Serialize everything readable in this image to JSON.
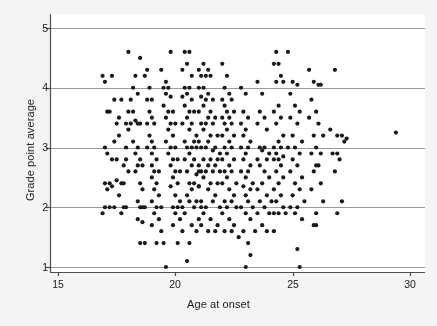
{
  "figure": {
    "background_color": "#f4f4f4",
    "plot_background_color": "#ffffff",
    "axis_color": "#4d4d4d",
    "grid_color": "#9a9a9a",
    "point_color": "#1a1a1a"
  },
  "chart_data": {
    "type": "scatter",
    "title": "",
    "subtitle": "",
    "xlabel": "Age at onset",
    "ylabel": "Grade point average",
    "xlim": [
      14.6,
      30.6
    ],
    "ylim": [
      0.85,
      5.15
    ],
    "xticks": [
      15,
      20,
      25,
      30
    ],
    "xtick_labels": [
      "15",
      "20",
      "25",
      "30"
    ],
    "yticks": [
      1,
      2,
      3,
      4,
      5
    ],
    "ytick_labels": [
      "1",
      "2",
      "3",
      "4",
      "5"
    ],
    "grid": "horizontal",
    "grid_at": [
      1,
      2,
      3,
      4,
      5
    ],
    "legend": "none",
    "marker": "filled-circle",
    "marker_size_px": 4.2,
    "n_points": 406,
    "points": [
      [
        16.9,
        4.2
      ],
      [
        17.0,
        4.1
      ],
      [
        17.3,
        4.2
      ],
      [
        17.1,
        3.6
      ],
      [
        17.2,
        3.6
      ],
      [
        17.0,
        3.0
      ],
      [
        17.1,
        2.9
      ],
      [
        17.0,
        2.4
      ],
      [
        17.2,
        2.4
      ],
      [
        17.3,
        2.35
      ],
      [
        17.1,
        2.3
      ],
      [
        17.0,
        2.0
      ],
      [
        16.9,
        1.9
      ],
      [
        17.2,
        2.0
      ],
      [
        17.4,
        2.0
      ],
      [
        17.3,
        2.8
      ],
      [
        17.5,
        2.8
      ],
      [
        17.4,
        3.1
      ],
      [
        17.6,
        3.2
      ],
      [
        17.5,
        3.4
      ],
      [
        17.6,
        3.5
      ],
      [
        17.4,
        3.8
      ],
      [
        17.7,
        3.8
      ],
      [
        17.5,
        2.45
      ],
      [
        17.7,
        2.4
      ],
      [
        17.8,
        2.4
      ],
      [
        17.6,
        2.2
      ],
      [
        17.8,
        2.0
      ],
      [
        17.7,
        1.9
      ],
      [
        17.9,
        2.0
      ],
      [
        17.8,
        2.7
      ],
      [
        17.9,
        2.8
      ],
      [
        18.0,
        2.6
      ],
      [
        17.9,
        3.0
      ],
      [
        18.0,
        3.3
      ],
      [
        18.1,
        3.4
      ],
      [
        17.9,
        3.4
      ],
      [
        18.0,
        3.6
      ],
      [
        18.2,
        3.6
      ],
      [
        18.1,
        3.8
      ],
      [
        18.0,
        4.6
      ],
      [
        18.3,
        4.2
      ],
      [
        18.2,
        4.0
      ],
      [
        18.4,
        3.9
      ],
      [
        18.3,
        3.45
      ],
      [
        18.5,
        3.4
      ],
      [
        18.4,
        3.4
      ],
      [
        18.2,
        3.1
      ],
      [
        18.4,
        3.0
      ],
      [
        18.3,
        2.9
      ],
      [
        18.5,
        2.8
      ],
      [
        18.4,
        2.7
      ],
      [
        18.6,
        2.7
      ],
      [
        18.3,
        2.6
      ],
      [
        18.5,
        2.4
      ],
      [
        18.6,
        2.3
      ],
      [
        18.4,
        2.1
      ],
      [
        18.6,
        2.0
      ],
      [
        18.5,
        2.0
      ],
      [
        18.7,
        2.0
      ],
      [
        18.4,
        1.8
      ],
      [
        18.6,
        1.75
      ],
      [
        18.5,
        1.4
      ],
      [
        18.7,
        1.4
      ],
      [
        18.5,
        4.5
      ],
      [
        18.8,
        4.3
      ],
      [
        18.7,
        4.2
      ],
      [
        18.9,
        4.0
      ],
      [
        18.8,
        3.8
      ],
      [
        19.0,
        3.8
      ],
      [
        18.9,
        3.6
      ],
      [
        19.0,
        3.5
      ],
      [
        18.8,
        3.4
      ],
      [
        19.1,
        3.4
      ],
      [
        18.9,
        3.2
      ],
      [
        19.0,
        3.1
      ],
      [
        18.8,
        3.0
      ],
      [
        19.1,
        3.0
      ],
      [
        19.0,
        2.9
      ],
      [
        19.2,
        2.8
      ],
      [
        19.0,
        2.7
      ],
      [
        19.1,
        2.6
      ],
      [
        19.3,
        2.6
      ],
      [
        19.0,
        2.5
      ],
      [
        19.2,
        2.4
      ],
      [
        19.1,
        2.3
      ],
      [
        19.3,
        2.2
      ],
      [
        19.0,
        2.1
      ],
      [
        19.2,
        2.0
      ],
      [
        19.4,
        2.0
      ],
      [
        19.1,
        1.9
      ],
      [
        19.3,
        1.8
      ],
      [
        19.0,
        1.7
      ],
      [
        19.4,
        1.6
      ],
      [
        19.2,
        1.4
      ],
      [
        19.5,
        1.4
      ],
      [
        19.6,
        1.0
      ],
      [
        19.4,
        4.3
      ],
      [
        19.6,
        4.1
      ],
      [
        19.5,
        4.0
      ],
      [
        19.7,
        4.0
      ],
      [
        19.6,
        3.9
      ],
      [
        19.8,
        3.85
      ],
      [
        19.5,
        3.7
      ],
      [
        19.7,
        3.6
      ],
      [
        19.9,
        3.6
      ],
      [
        19.6,
        3.5
      ],
      [
        19.8,
        3.4
      ],
      [
        20.0,
        3.4
      ],
      [
        19.7,
        3.3
      ],
      [
        19.9,
        3.2
      ],
      [
        19.6,
        3.1
      ],
      [
        19.8,
        3.0
      ],
      [
        20.0,
        3.0
      ],
      [
        19.7,
        2.9
      ],
      [
        19.9,
        2.8
      ],
      [
        20.1,
        2.8
      ],
      [
        19.8,
        2.7
      ],
      [
        20.0,
        2.6
      ],
      [
        20.2,
        2.6
      ],
      [
        19.9,
        2.5
      ],
      [
        20.1,
        2.4
      ],
      [
        19.8,
        2.35
      ],
      [
        20.0,
        2.2
      ],
      [
        20.2,
        2.1
      ],
      [
        19.9,
        2.0
      ],
      [
        20.1,
        2.0
      ],
      [
        20.3,
        2.0
      ],
      [
        20.0,
        1.9
      ],
      [
        20.2,
        1.8
      ],
      [
        19.9,
        1.7
      ],
      [
        20.3,
        1.6
      ],
      [
        20.1,
        1.4
      ],
      [
        20.4,
        4.6
      ],
      [
        19.8,
        4.6
      ],
      [
        20.6,
        4.6
      ],
      [
        20.5,
        4.4
      ],
      [
        20.3,
        4.3
      ],
      [
        20.7,
        4.2
      ],
      [
        20.4,
        4.0
      ],
      [
        20.6,
        4.0
      ],
      [
        20.5,
        3.9
      ],
      [
        20.3,
        3.85
      ],
      [
        20.7,
        3.8
      ],
      [
        20.4,
        3.7
      ],
      [
        20.6,
        3.6
      ],
      [
        20.8,
        3.6
      ],
      [
        20.5,
        3.5
      ],
      [
        20.3,
        3.4
      ],
      [
        20.7,
        3.4
      ],
      [
        20.6,
        3.3
      ],
      [
        20.9,
        3.2
      ],
      [
        20.4,
        3.1
      ],
      [
        20.8,
        3.1
      ],
      [
        20.5,
        3.0
      ],
      [
        20.7,
        3.0
      ],
      [
        20.9,
        3.0
      ],
      [
        20.6,
        2.9
      ],
      [
        20.4,
        2.8
      ],
      [
        20.8,
        2.8
      ],
      [
        20.7,
        2.7
      ],
      [
        21.0,
        2.6
      ],
      [
        20.5,
        2.6
      ],
      [
        20.9,
        2.55
      ],
      [
        20.6,
        2.4
      ],
      [
        20.8,
        2.4
      ],
      [
        21.0,
        2.35
      ],
      [
        20.7,
        2.3
      ],
      [
        20.5,
        2.2
      ],
      [
        20.9,
        2.1
      ],
      [
        20.6,
        2.1
      ],
      [
        21.1,
        2.0
      ],
      [
        20.8,
        2.0
      ],
      [
        20.4,
        1.9
      ],
      [
        21.0,
        1.8
      ],
      [
        20.7,
        1.7
      ],
      [
        21.1,
        1.7
      ],
      [
        20.9,
        1.6
      ],
      [
        20.6,
        1.4
      ],
      [
        20.5,
        1.1
      ],
      [
        21.2,
        4.4
      ],
      [
        21.0,
        4.3
      ],
      [
        21.4,
        4.3
      ],
      [
        21.1,
        4.2
      ],
      [
        21.3,
        4.2
      ],
      [
        21.5,
        4.2
      ],
      [
        21.2,
        4.0
      ],
      [
        21.0,
        4.0
      ],
      [
        21.4,
        3.9
      ],
      [
        21.1,
        3.85
      ],
      [
        21.3,
        3.8
      ],
      [
        21.6,
        3.8
      ],
      [
        21.2,
        3.7
      ],
      [
        21.5,
        3.6
      ],
      [
        21.0,
        3.6
      ],
      [
        21.4,
        3.5
      ],
      [
        21.7,
        3.5
      ],
      [
        21.1,
        3.4
      ],
      [
        21.3,
        3.4
      ],
      [
        21.6,
        3.4
      ],
      [
        21.2,
        3.3
      ],
      [
        21.5,
        3.2
      ],
      [
        21.8,
        3.2
      ],
      [
        21.0,
        3.1
      ],
      [
        21.4,
        3.1
      ],
      [
        21.7,
        3.0
      ],
      [
        21.1,
        3.0
      ],
      [
        21.3,
        3.0
      ],
      [
        21.6,
        2.95
      ],
      [
        21.9,
        2.9
      ],
      [
        21.2,
        2.8
      ],
      [
        21.5,
        2.8
      ],
      [
        21.8,
        2.8
      ],
      [
        21.0,
        2.7
      ],
      [
        21.4,
        2.7
      ],
      [
        21.7,
        2.7
      ],
      [
        21.1,
        2.6
      ],
      [
        21.3,
        2.6
      ],
      [
        21.6,
        2.6
      ],
      [
        21.9,
        2.6
      ],
      [
        21.2,
        2.5
      ],
      [
        21.5,
        2.4
      ],
      [
        21.8,
        2.4
      ],
      [
        21.0,
        2.35
      ],
      [
        21.4,
        2.3
      ],
      [
        21.7,
        2.2
      ],
      [
        21.1,
        2.1
      ],
      [
        21.6,
        2.1
      ],
      [
        21.3,
        2.0
      ],
      [
        21.9,
        2.0
      ],
      [
        21.2,
        1.9
      ],
      [
        21.5,
        1.8
      ],
      [
        21.8,
        1.7
      ],
      [
        21.4,
        1.6
      ],
      [
        21.7,
        1.6
      ],
      [
        22.0,
        4.4
      ],
      [
        22.2,
        4.2
      ],
      [
        22.1,
        4.0
      ],
      [
        22.3,
        3.9
      ],
      [
        22.0,
        3.8
      ],
      [
        22.4,
        3.8
      ],
      [
        22.1,
        3.7
      ],
      [
        22.2,
        3.6
      ],
      [
        22.5,
        3.6
      ],
      [
        22.0,
        3.5
      ],
      [
        22.3,
        3.5
      ],
      [
        22.1,
        3.4
      ],
      [
        22.4,
        3.4
      ],
      [
        22.2,
        3.3
      ],
      [
        22.0,
        3.2
      ],
      [
        22.5,
        3.2
      ],
      [
        22.3,
        3.1
      ],
      [
        22.1,
        3.0
      ],
      [
        22.4,
        3.0
      ],
      [
        22.2,
        2.9
      ],
      [
        22.0,
        2.8
      ],
      [
        22.5,
        2.8
      ],
      [
        22.3,
        2.7
      ],
      [
        22.1,
        2.6
      ],
      [
        22.4,
        2.6
      ],
      [
        22.2,
        2.5
      ],
      [
        22.6,
        2.4
      ],
      [
        22.0,
        2.4
      ],
      [
        22.3,
        2.3
      ],
      [
        22.5,
        2.2
      ],
      [
        22.1,
        2.1
      ],
      [
        22.4,
        2.1
      ],
      [
        22.2,
        2.0
      ],
      [
        22.6,
        2.0
      ],
      [
        22.0,
        1.9
      ],
      [
        22.3,
        1.8
      ],
      [
        22.5,
        1.7
      ],
      [
        22.1,
        1.6
      ],
      [
        22.4,
        1.6
      ],
      [
        22.7,
        1.5
      ],
      [
        22.8,
        4.0
      ],
      [
        23.0,
        3.9
      ],
      [
        22.9,
        3.6
      ],
      [
        23.1,
        3.5
      ],
      [
        22.8,
        3.4
      ],
      [
        23.0,
        3.3
      ],
      [
        22.9,
        3.2
      ],
      [
        23.2,
        3.1
      ],
      [
        22.8,
        3.0
      ],
      [
        23.1,
        3.0
      ],
      [
        23.0,
        2.9
      ],
      [
        22.9,
        2.8
      ],
      [
        23.2,
        2.7
      ],
      [
        22.8,
        2.6
      ],
      [
        23.1,
        2.6
      ],
      [
        23.0,
        2.5
      ],
      [
        23.3,
        2.4
      ],
      [
        22.9,
        2.35
      ],
      [
        23.2,
        2.3
      ],
      [
        23.0,
        2.2
      ],
      [
        23.1,
        2.1
      ],
      [
        22.8,
        2.0
      ],
      [
        23.3,
        2.0
      ],
      [
        23.0,
        1.9
      ],
      [
        23.2,
        1.8
      ],
      [
        22.9,
        1.6
      ],
      [
        23.4,
        1.6
      ],
      [
        23.1,
        1.4
      ],
      [
        23.2,
        1.2
      ],
      [
        23.0,
        1.0
      ],
      [
        23.5,
        4.1
      ],
      [
        23.7,
        3.9
      ],
      [
        23.6,
        3.6
      ],
      [
        23.8,
        3.5
      ],
      [
        23.5,
        3.4
      ],
      [
        23.9,
        3.3
      ],
      [
        23.6,
        3.0
      ],
      [
        23.8,
        3.0
      ],
      [
        23.7,
        2.95
      ],
      [
        24.0,
        2.9
      ],
      [
        23.5,
        2.8
      ],
      [
        23.9,
        2.8
      ],
      [
        23.6,
        2.7
      ],
      [
        23.8,
        2.6
      ],
      [
        24.0,
        2.5
      ],
      [
        23.7,
        2.4
      ],
      [
        23.5,
        2.3
      ],
      [
        23.9,
        2.2
      ],
      [
        23.6,
        2.1
      ],
      [
        24.1,
        2.1
      ],
      [
        23.8,
        2.0
      ],
      [
        23.5,
        1.9
      ],
      [
        24.0,
        1.9
      ],
      [
        23.7,
        1.7
      ],
      [
        23.9,
        1.6
      ],
      [
        24.2,
        1.6
      ],
      [
        24.3,
        4.6
      ],
      [
        24.4,
        4.4
      ],
      [
        24.2,
        4.4
      ],
      [
        24.5,
        4.2
      ],
      [
        24.3,
        4.1
      ],
      [
        24.6,
        4.1
      ],
      [
        24.4,
        3.7
      ],
      [
        24.2,
        3.6
      ],
      [
        24.5,
        3.5
      ],
      [
        24.3,
        3.4
      ],
      [
        24.6,
        3.2
      ],
      [
        24.4,
        3.1
      ],
      [
        24.2,
        3.0
      ],
      [
        24.5,
        3.0
      ],
      [
        24.3,
        2.9
      ],
      [
        24.6,
        2.85
      ],
      [
        24.4,
        2.8
      ],
      [
        24.2,
        2.8
      ],
      [
        24.5,
        2.7
      ],
      [
        24.3,
        2.6
      ],
      [
        24.6,
        2.5
      ],
      [
        24.4,
        2.4
      ],
      [
        24.2,
        2.3
      ],
      [
        24.5,
        2.2
      ],
      [
        24.3,
        2.1
      ],
      [
        24.6,
        2.0
      ],
      [
        24.4,
        1.9
      ],
      [
        24.7,
        1.9
      ],
      [
        24.2,
        1.9
      ],
      [
        24.8,
        4.6
      ],
      [
        25.0,
        4.1
      ],
      [
        25.2,
        4.05
      ],
      [
        24.9,
        3.9
      ],
      [
        25.1,
        3.7
      ],
      [
        25.3,
        3.6
      ],
      [
        24.9,
        3.5
      ],
      [
        25.2,
        3.4
      ],
      [
        25.0,
        3.2
      ],
      [
        25.4,
        3.1
      ],
      [
        24.8,
        3.0
      ],
      [
        25.1,
        3.0
      ],
      [
        25.3,
        2.9
      ],
      [
        25.0,
        2.8
      ],
      [
        25.2,
        2.7
      ],
      [
        24.9,
        2.6
      ],
      [
        25.4,
        2.5
      ],
      [
        25.1,
        2.4
      ],
      [
        25.3,
        2.3
      ],
      [
        25.0,
        2.2
      ],
      [
        25.5,
        2.1
      ],
      [
        25.2,
        2.0
      ],
      [
        24.9,
        2.0
      ],
      [
        25.1,
        1.9
      ],
      [
        25.4,
        1.8
      ],
      [
        25.2,
        1.3
      ],
      [
        25.3,
        1.0
      ],
      [
        25.7,
        4.3
      ],
      [
        25.9,
        4.1
      ],
      [
        26.1,
        4.05
      ],
      [
        26.2,
        4.05
      ],
      [
        25.8,
        3.8
      ],
      [
        26.0,
        3.6
      ],
      [
        25.7,
        3.5
      ],
      [
        26.1,
        3.4
      ],
      [
        25.9,
        3.2
      ],
      [
        26.3,
        3.2
      ],
      [
        26.0,
        3.0
      ],
      [
        25.8,
        2.9
      ],
      [
        26.2,
        2.9
      ],
      [
        26.0,
        2.7
      ],
      [
        26.1,
        2.7
      ],
      [
        25.9,
        2.6
      ],
      [
        26.2,
        2.4
      ],
      [
        25.8,
        2.3
      ],
      [
        26.3,
        2.1
      ],
      [
        26.0,
        1.9
      ],
      [
        25.9,
        1.7
      ],
      [
        26.0,
        1.7
      ],
      [
        26.8,
        4.3
      ],
      [
        26.6,
        3.3
      ],
      [
        26.9,
        3.2
      ],
      [
        27.1,
        3.2
      ],
      [
        27.3,
        3.15
      ],
      [
        26.7,
        2.9
      ],
      [
        26.9,
        2.9
      ],
      [
        27.0,
        2.8
      ],
      [
        26.8,
        2.6
      ],
      [
        27.1,
        2.1
      ],
      [
        26.9,
        1.9
      ],
      [
        27.2,
        3.1
      ],
      [
        29.4,
        3.25
      ]
    ]
  },
  "labels": {
    "x_axis_title": "Age at onset",
    "y_axis_title": "Grade point average"
  }
}
